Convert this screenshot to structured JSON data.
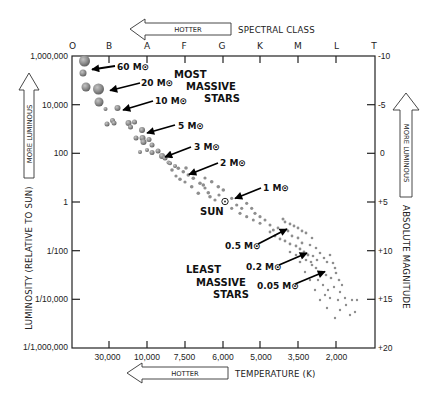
{
  "chart_data": {
    "type": "scatter",
    "top_axis": {
      "arrow_label": "HOTTER",
      "title": "SPECTRAL CLASS",
      "classes": [
        "O",
        "B",
        "A",
        "F",
        "G",
        "K",
        "M",
        "L",
        "T"
      ]
    },
    "bottom_axis": {
      "arrow_label": "HOTTER",
      "title": "TEMPERATURE (K)",
      "ticks": [
        "30,000",
        "10,000",
        "7,500",
        "6,000",
        "5,000",
        "3,500",
        "2,000"
      ]
    },
    "left_axis": {
      "arrow_label": "MORE LUMINOUS",
      "title": "LUMINOSITY (RELATIVE TO SUN)",
      "ticks": [
        "1,000,000",
        "10,000",
        "100",
        "1",
        "1/100",
        "1/10,000",
        "1/1,000,000"
      ],
      "scale": "log"
    },
    "right_axis": {
      "arrow_label": "MORE LUMINOUS",
      "title": "ABSOLUTE MAGNITUDE",
      "ticks": [
        "-10",
        "-5",
        "0",
        "+5",
        "+10",
        "+15",
        "+20"
      ]
    },
    "grid": false,
    "legend": "none",
    "annotations": {
      "most_massive": [
        "MOST",
        "MASSIVE",
        "STARS"
      ],
      "least_massive": [
        "LEAST",
        "MASSIVE",
        "STARS"
      ],
      "sun_label": "SUN",
      "mass_labels": [
        "60 M⊙",
        "20 M⊙",
        "10 M⊙",
        "5 M⊙",
        "3 M⊙",
        "2 M⊙",
        "1 M⊙",
        "0.5 M⊙",
        "0.2 M⊙",
        "0.05 M⊙"
      ]
    },
    "plot_area_px": {
      "x": 72,
      "y": 56,
      "width": 303,
      "height": 292
    },
    "series": [
      {
        "name": "main-sequence stars",
        "point_format": "[x_px, y_px, radius_px]",
        "points": [
          [
            84.5,
            61,
            5.5
          ],
          [
            83,
            73,
            3.5
          ],
          [
            86,
            87,
            4.5
          ],
          [
            98.5,
            89,
            5.5
          ],
          [
            99,
            102,
            4.5
          ],
          [
            105.5,
            109,
            2
          ],
          [
            117.5,
            108,
            3
          ],
          [
            107,
            124,
            2.5
          ],
          [
            112.5,
            120.5,
            2.5
          ],
          [
            114,
            123,
            2.5
          ],
          [
            128.5,
            123,
            3
          ],
          [
            130.5,
            127,
            2.5
          ],
          [
            134.5,
            122,
            2.5
          ],
          [
            142,
            130,
            3
          ],
          [
            136,
            138,
            2.5
          ],
          [
            142.5,
            138,
            3
          ],
          [
            143.5,
            142,
            3
          ],
          [
            149,
            139.5,
            2.5
          ],
          [
            152,
            145,
            2.5
          ],
          [
            140,
            152,
            2
          ],
          [
            147,
            150,
            2
          ],
          [
            152,
            152.5,
            2.5
          ],
          [
            158,
            151,
            2.5
          ],
          [
            162,
            156,
            3
          ],
          [
            165,
            158,
            2.5
          ],
          [
            168.5,
            162.5,
            2
          ],
          [
            170,
            163.3,
            2
          ],
          [
            175,
            166,
            2
          ],
          [
            178.3,
            168.3,
            1.8
          ],
          [
            183.3,
            171.7,
            1.8
          ],
          [
            188.3,
            175,
            1.8
          ],
          [
            193.3,
            178.3,
            1.8
          ],
          [
            200,
            183.3,
            1.8
          ],
          [
            203.3,
            185,
            1.8
          ],
          [
            211.7,
            181.7,
            1.8
          ],
          [
            218.3,
            186.7,
            1.8
          ],
          [
            223.3,
            190,
            1.8
          ],
          [
            180,
            179.3,
            1.8
          ],
          [
            191.7,
            186.7,
            1.8
          ],
          [
            198.3,
            193.3,
            1.8
          ],
          [
            208.3,
            192.7,
            1.8
          ],
          [
            210,
            196.7,
            1.8
          ],
          [
            215,
            200,
            1.6
          ],
          [
            226.7,
            201.7,
            1.6
          ],
          [
            231.7,
            198.3,
            1.6
          ],
          [
            236.7,
            205,
            1.6
          ],
          [
            241.7,
            208.3,
            1.6
          ],
          [
            246.7,
            203.3,
            1.6
          ],
          [
            251.7,
            208.3,
            1.6
          ],
          [
            255,
            213.3,
            1.6
          ],
          [
            260,
            216.7,
            1.6
          ],
          [
            231.7,
            208.3,
            1.6
          ],
          [
            240,
            213.3,
            1.6
          ],
          [
            246.7,
            216.7,
            1.6
          ],
          [
            253.3,
            220,
            1.5
          ],
          [
            260,
            223.3,
            1.5
          ],
          [
            265,
            220,
            1.5
          ],
          [
            270,
            225,
            1.5
          ],
          [
            273.3,
            230,
            1.5
          ],
          [
            172,
            170,
            1.8
          ],
          [
            186,
            168,
            1.8
          ],
          [
            195,
            173,
            1.8
          ],
          [
            205,
            178,
            1.6
          ],
          [
            176,
            176,
            1.6
          ],
          [
            185,
            182,
            1.6
          ],
          [
            205,
            188,
            1.6
          ],
          [
            219,
            195,
            1.6
          ],
          [
            283,
            219,
            1.5
          ],
          [
            285,
            222,
            1.4
          ],
          [
            290,
            224,
            1.4
          ],
          [
            294,
            226,
            1.4
          ],
          [
            298,
            228,
            1.4
          ],
          [
            302,
            231,
            1.4
          ],
          [
            306,
            233,
            1.4
          ],
          [
            270,
            232,
            1.4
          ],
          [
            275,
            236,
            1.4
          ],
          [
            280,
            239,
            1.4
          ],
          [
            285,
            241,
            1.4
          ],
          [
            290,
            244,
            1.4
          ],
          [
            296,
            246,
            1.4
          ],
          [
            300,
            249,
            1.4
          ],
          [
            304,
            252,
            1.4
          ],
          [
            308,
            255,
            1.4
          ],
          [
            292,
            236,
            1.4
          ],
          [
            298,
            238,
            1.4
          ],
          [
            302,
            243,
            1.4
          ],
          [
            310,
            245,
            1.3
          ],
          [
            278,
            228,
            1.4
          ],
          [
            288,
            231,
            1.4
          ],
          [
            312,
            238,
            1.3
          ],
          [
            316,
            248,
            1.3
          ],
          [
            306,
            260,
            1.3
          ],
          [
            311,
            262,
            1.3
          ],
          [
            296,
            255,
            1.3
          ],
          [
            300,
            262,
            1.3
          ],
          [
            290,
            252,
            1.3
          ],
          [
            313,
            256,
            1.3
          ],
          [
            317,
            260,
            1.3
          ],
          [
            320,
            253,
            1.3
          ],
          [
            324,
            258,
            1.3
          ],
          [
            327,
            262,
            1.3
          ],
          [
            330,
            255,
            1.3
          ],
          [
            333,
            263,
            1.3
          ],
          [
            335,
            268,
            1.3
          ],
          [
            312,
            265,
            1.3
          ],
          [
            316,
            268,
            1.3
          ],
          [
            322,
            272,
            1.3
          ],
          [
            326,
            275,
            1.3
          ],
          [
            331,
            278,
            1.3
          ],
          [
            336,
            273,
            1.3
          ],
          [
            339,
            280,
            1.3
          ],
          [
            318,
            280,
            1.2
          ],
          [
            323,
            285,
            1.2
          ],
          [
            328,
            290,
            1.2
          ],
          [
            334,
            287,
            1.2
          ],
          [
            340,
            292,
            1.2
          ],
          [
            342,
            285,
            1.2
          ],
          [
            345,
            298,
            1.2
          ],
          [
            338,
            300,
            1.2
          ],
          [
            330,
            298,
            1.2
          ],
          [
            325,
            295,
            1.2
          ],
          [
            346,
            305,
            1.2
          ],
          [
            352,
            300,
            1.2
          ],
          [
            355,
            312,
            1.2
          ],
          [
            340,
            310,
            1.2
          ],
          [
            335,
            318,
            1.2
          ],
          [
            327,
            308,
            1.2
          ],
          [
            320,
            300,
            1.2
          ],
          [
            350,
            315,
            1.2
          ],
          [
            357,
            300,
            1.2
          ],
          [
            305,
            272,
            1.2
          ],
          [
            310,
            280,
            1.2
          ],
          [
            315,
            290,
            1.2
          ]
        ]
      }
    ],
    "colors": {
      "star_light": "#c4c4c4",
      "star_mid": "#8e8e8e",
      "star_dark": "#5a5a5a",
      "ink": "#222222"
    }
  }
}
